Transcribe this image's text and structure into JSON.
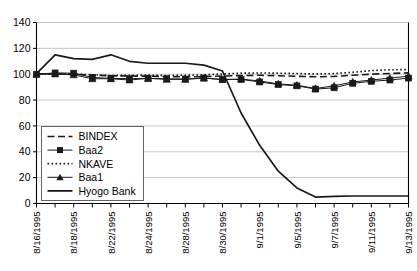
{
  "chart_data": {
    "type": "line",
    "title": "",
    "xlabel": "",
    "ylabel": "",
    "ylim": [
      0,
      140
    ],
    "ytick_step": 20,
    "yticks": [
      "0",
      "20",
      "40",
      "60",
      "80",
      "100",
      "120",
      "140"
    ],
    "grid": true,
    "legend_position": "inside-lower-left",
    "x": [
      "8/16/1995",
      "8/17/1995",
      "8/18/1995",
      "8/21/1995",
      "8/22/1995",
      "8/23/1995",
      "8/24/1995",
      "8/25/1995",
      "8/28/1995",
      "8/29/1995",
      "8/30/1995",
      "8/31/1995",
      "9/1/1995",
      "9/4/1995",
      "9/5/1995",
      "9/6/1995",
      "9/7/1995",
      "9/8/1995",
      "9/11/1995",
      "9/12/1995",
      "9/13/1995"
    ],
    "xtick_labels": [
      "8/16/1995",
      "",
      "8/18/1995",
      "",
      "8/22/1995",
      "",
      "8/24/1995",
      "",
      "8/28/1995",
      "",
      "8/30/1995",
      "",
      "9/1/1995",
      "",
      "9/5/1995",
      "",
      "9/7/1995",
      "",
      "9/11/1995",
      "",
      "9/13/1995"
    ],
    "series": [
      {
        "name": "BINDEX",
        "style": "dashed",
        "marker": "none",
        "color": "#1a1a1a",
        "values": [
          100.0,
          100.3,
          100.0,
          99.3,
          98.8,
          98.6,
          98.5,
          98.2,
          98.0,
          98.2,
          98.6,
          99.0,
          99.2,
          98.8,
          98.4,
          98.0,
          98.3,
          99.2,
          100.0,
          100.6,
          101.0
        ]
      },
      {
        "name": "Baa2",
        "style": "solid",
        "marker": "square",
        "color": "#1a1a1a",
        "values": [
          100.0,
          101.0,
          100.8,
          97.5,
          96.8,
          96.5,
          96.8,
          96.5,
          96.3,
          97.0,
          95.8,
          96.0,
          94.0,
          92.0,
          91.0,
          88.5,
          89.5,
          93.0,
          94.5,
          95.5,
          97.0
        ]
      },
      {
        "name": "NKAVE",
        "style": "dotted",
        "marker": "none",
        "color": "#1a1a1a",
        "values": [
          100.0,
          100.2,
          100.3,
          99.5,
          99.0,
          99.2,
          99.3,
          99.0,
          99.2,
          99.5,
          100.2,
          100.8,
          101.0,
          100.8,
          100.5,
          100.2,
          100.5,
          101.5,
          102.8,
          103.4,
          103.6
        ]
      },
      {
        "name": "Baa1",
        "style": "solid",
        "marker": "triangle",
        "color": "#1a1a1a",
        "values": [
          100.0,
          100.2,
          99.5,
          96.5,
          96.5,
          95.5,
          96.8,
          96.0,
          96.0,
          97.0,
          96.0,
          96.2,
          94.8,
          92.5,
          91.5,
          89.0,
          91.0,
          94.0,
          95.5,
          97.0,
          98.5
        ]
      },
      {
        "name": "Hyogo Bank",
        "style": "solid",
        "marker": "none",
        "color": "#1a1a1a",
        "values": [
          100.5,
          115.0,
          112.0,
          111.5,
          115.0,
          110.0,
          108.5,
          108.5,
          108.5,
          107.0,
          102.5,
          70.0,
          45.0,
          25.0,
          12.0,
          5.0,
          5.5,
          5.8,
          5.8,
          5.8,
          5.8
        ]
      }
    ],
    "legend": [
      {
        "label": "BINDEX",
        "style": "dashed",
        "marker": "none"
      },
      {
        "label": "Baa2",
        "style": "solid",
        "marker": "square"
      },
      {
        "label": "NKAVE",
        "style": "dotted",
        "marker": "none"
      },
      {
        "label": "Baa1",
        "style": "solid",
        "marker": "triangle"
      },
      {
        "label": "Hyogo Bank",
        "style": "solid",
        "marker": "none"
      }
    ]
  }
}
